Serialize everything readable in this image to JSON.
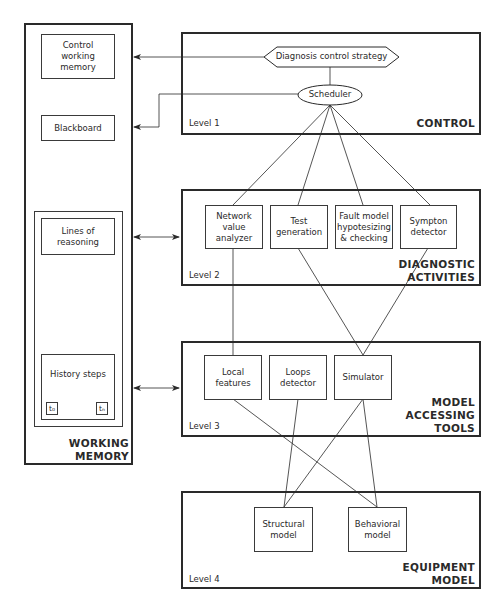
{
  "working_memory": {
    "title": "WORKING\nMEMORY",
    "control_working_memory": "Control\nworking\nmemory",
    "blackboard": "Blackboard",
    "lines_of_reasoning": "Lines of\nreasoning",
    "history_steps": "History steps",
    "t0": "t₀",
    "tn": "tₙ"
  },
  "levels": [
    {
      "label": "Level 1",
      "title": "CONTROL",
      "strategy": "Diagnosis control strategy",
      "scheduler": "Scheduler"
    },
    {
      "label": "Level 2",
      "title": "DIAGNOSTIC\nACTIVITIES",
      "nodes": [
        "Network\nvalue\nanalyzer",
        "Test\ngeneration",
        "Fault model\nhypotesizing\n& checking",
        "Sympton\ndetector"
      ]
    },
    {
      "label": "Level 3",
      "title": "MODEL\nACCESSING\nTOOLS",
      "nodes": [
        "Local\nfeatures",
        "Loops\ndetector",
        "Simulator"
      ]
    },
    {
      "label": "Level 4",
      "title": "EQUIPMENT\nMODEL",
      "nodes": [
        "Structural\nmodel",
        "Behavioral\nmodel"
      ]
    }
  ],
  "colors": {
    "line": "#2a2a2a",
    "background": "#ffffff"
  }
}
